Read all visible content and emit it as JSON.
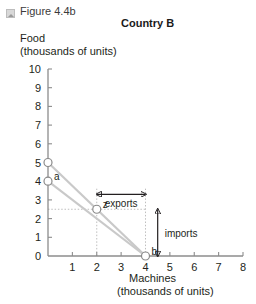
{
  "figure": {
    "icon": "image-placeholder-icon",
    "caption": "Figure 4.4b",
    "title": "Country B"
  },
  "chart_data": {
    "type": "line",
    "title": "Country B",
    "xlabel": "Machines",
    "xlabel_units": "(thousands of units)",
    "ylabel": "Food",
    "ylabel_units": "(thousands of units)",
    "xlim": [
      0,
      8
    ],
    "ylim": [
      0,
      10
    ],
    "xticks": [
      "0",
      "1",
      "2",
      "3",
      "4",
      "5",
      "6",
      "7",
      "8"
    ],
    "yticks": [
      "0",
      "1",
      "2",
      "3",
      "4",
      "5",
      "6",
      "7",
      "8",
      "9",
      "10"
    ],
    "grid": false,
    "legend": "none",
    "line_color": "#c9c9c9",
    "marker_edge_color": "#8a8a8a",
    "guide_color": "#bfbfbf",
    "series": [
      {
        "name": "trading-line",
        "points": [
          {
            "x": 0,
            "y": 5
          },
          {
            "x": 4,
            "y": 0
          }
        ]
      },
      {
        "name": "production-possibility-frontier",
        "points": [
          {
            "x": 0,
            "y": 4
          },
          {
            "x": 4,
            "y": 0
          }
        ]
      }
    ],
    "points": [
      {
        "label": "a",
        "x": 0,
        "y": 4
      },
      {
        "label": "z",
        "x": 2,
        "y": 2.5
      },
      {
        "label": "b",
        "x": 4,
        "y": 0
      },
      {
        "label": "",
        "x": 0,
        "y": 5
      }
    ],
    "annotations": [
      {
        "name": "exports",
        "text": "exports",
        "orientation": "horizontal",
        "from": {
          "x": 2,
          "y": 3.3
        },
        "to": {
          "x": 4,
          "y": 3.3
        }
      },
      {
        "name": "imports",
        "text": "imports",
        "orientation": "vertical",
        "from": {
          "x": 4.5,
          "y": 0
        },
        "to": {
          "x": 4.5,
          "y": 2.5
        }
      }
    ],
    "guides": [
      {
        "type": "vertical",
        "x": 2,
        "from_y": 0,
        "to_y": 3.6
      },
      {
        "type": "vertical",
        "x": 4,
        "from_y": 0,
        "to_y": 3.6
      },
      {
        "type": "horizontal",
        "y": 2.5,
        "from_x": 0,
        "to_x": 4
      }
    ]
  }
}
